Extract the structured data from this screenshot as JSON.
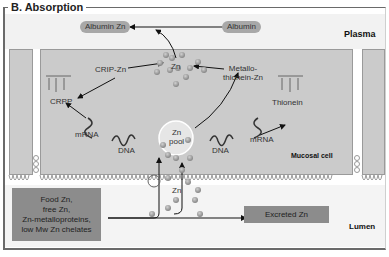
{
  "panel": {
    "title": "B. Absorption"
  },
  "compartments": {
    "plasma": "Plasma",
    "mucosal_cell": "Mucosal cell",
    "lumen": "Lumen"
  },
  "plasma": {
    "albumin": "Albumin",
    "albumin_zn": "Albumin",
    "albumin_zn_suffix": "Zn"
  },
  "cell": {
    "zn_cluster": "Zn",
    "crip_zn": "CRIP-Zn",
    "crpp": "CRPP",
    "mrna_left": "mRNA",
    "dna_left": "DNA",
    "zn_pool_line1": "Zn",
    "zn_pool_line2": "pool",
    "dna_right": "DNA",
    "mrna_right": "mRNA",
    "thionein": "Thionein",
    "metallothionein_line1": "Metallo-",
    "metallothionein_line2": "thionein-Zn"
  },
  "lumen": {
    "food_zn_lines": [
      "Food Zn,",
      "free Zn,",
      "Zn-metalloproteins,",
      "low Mw Zn chelates"
    ],
    "zn_transport": "Zn",
    "excreted_zn": "Excreted Zn"
  },
  "colors": {
    "cell_fill": "#cbcbcb",
    "box_fill": "#8c8c8c",
    "pill_fill": "#a8a8a8",
    "zn_particle": "#9a9a9a"
  }
}
